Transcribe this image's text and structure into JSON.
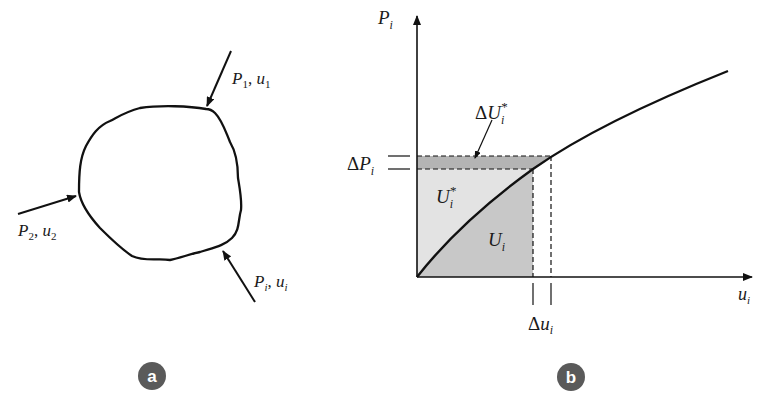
{
  "figure": {
    "panel_a": {
      "badge": "a",
      "loads": [
        {
          "P": "P",
          "sub": "1",
          "u": "u",
          "usub": "1"
        },
        {
          "P": "P",
          "sub": "2",
          "u": "u",
          "usub": "2"
        },
        {
          "P": "P",
          "sub": "i",
          "u": "u",
          "usub": "i"
        }
      ]
    },
    "panel_b": {
      "badge": "b",
      "y_axis": {
        "sym": "P",
        "sub": "i"
      },
      "x_axis": {
        "sym": "u",
        "sub": "i"
      },
      "delta_P": {
        "pre": "Δ",
        "sym": "P",
        "sub": "i"
      },
      "delta_u": {
        "pre": "Δ",
        "sym": "u",
        "sub": "i"
      },
      "delta_U_star": {
        "pre": "Δ",
        "sym": "U",
        "sub": "i",
        "sup": "*"
      },
      "U_star": {
        "sym": "U",
        "sub": "i",
        "sup": "*"
      },
      "U": {
        "sym": "U",
        "sub": "i"
      }
    },
    "colors": {
      "line": "#111111",
      "complementary_fill": "#e3e3e3",
      "strain_energy_fill": "#c8c8c8",
      "delta_fill": "#b4b4b4",
      "badge": "#5a5a5a"
    }
  }
}
